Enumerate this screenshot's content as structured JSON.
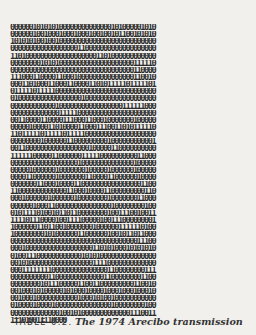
{
  "page": {
    "binary_rows": [
      "000000101010100000000000000101000001010",
      "000000100100010001000100100101100101010",
      "101010100100100000000000000000000000000",
      "000000000000000000110000000000000000000",
      "110100000000000000000001101000000000000",
      "000000001010100000000000000000000111110",
      "000000000000000000000000000000000110000",
      "111000110000110001000000000000000110010",
      "000110100011000110000110101111101111101",
      "011111011111000000000000000000000000000",
      "010000000000000000010000000000000000000",
      "000000000000100000000000000000111111000",
      "000000000000011111000000000000000000000",
      "001100001100001110001100010000000100000",
      "000001000011010000110001110011010111110",
      "110111110111110111110000000000000000000",
      "000000001000000110000000001000000000001",
      "001100000000000000000100000110000000000",
      "111111000001100000011111000000000011000",
      "000000000000000000100000000000000100000",
      "000001000000100000001000001000000100000",
      "000011000000100000001100001100000010000",
      "000000011000100001100000000000000001100",
      "110000000000000110001000011000000000110",
      "000100000010000001000000001000000011000",
      "000000100011000000000000000100000000100",
      "010111101001011011000000001001110010011",
      "111101110000100111100000100111000000001",
      "100000011011001000000010000001111110100",
      "100000000101000000110000001001011011000",
      "000000000000000000000000000000000011100",
      "000100000000000000000011010100010101010",
      "010011100000000000010101000000000000000",
      "001010000000000000000011110000000000000",
      "000111111110000000000000001100000000111",
      "000000000011000000000000011000000001100",
      "000000001011100000110011000000000110010",
      "001000101000001010001000010001000100010",
      "001000100000000000100010100100000000000",
      "010000100001000000000000000100000000100",
      "000000000000010010100000000000001110011",
      "111010011110000"
    ],
    "caption": {
      "label": "TABLE 6.2.",
      "title": "The 1974 Arecibo transmission"
    }
  }
}
